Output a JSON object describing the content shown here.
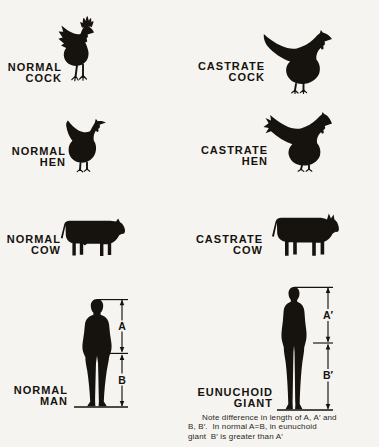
{
  "colors": {
    "background": "#f5f4f0",
    "ink": "#16130f"
  },
  "specimens": [
    {
      "name": "normal-cock",
      "label": [
        "NORMAL",
        "COCK"
      ],
      "icon": "rooster-large-comb-silhouette"
    },
    {
      "name": "castrate-cock",
      "label": [
        "CASTRATE",
        "COCK"
      ],
      "icon": "capon-silhouette"
    },
    {
      "name": "normal-hen",
      "label": [
        "NORMAL",
        "HEN"
      ],
      "icon": "hen-silhouette"
    },
    {
      "name": "castrate-hen",
      "label": [
        "CASTRATE",
        "HEN"
      ],
      "icon": "poularde-long-tail-silhouette"
    },
    {
      "name": "normal-cow",
      "label": [
        "NORMAL",
        "COW"
      ],
      "icon": "cow-silhouette"
    },
    {
      "name": "castrate-cow",
      "label": [
        "CASTRATE",
        "COW"
      ],
      "icon": "ox-horned-silhouette"
    },
    {
      "name": "normal-man",
      "label": [
        "NORMAL",
        "MAN"
      ],
      "icon": "man-silhouette"
    },
    {
      "name": "eunuchoid-giant",
      "label": [
        "EUNUCHOID",
        "GIANT"
      ],
      "icon": "tall-man-silhouette"
    }
  ],
  "measurements": {
    "normal_man": {
      "upper": "A",
      "lower": "B"
    },
    "eunuchoid_giant": {
      "upper": "A′",
      "lower": "B′"
    }
  },
  "note": {
    "lines": [
      "Note difference in length of A, A′ and",
      "B, B′.  In normal A=B, in eunuchoid",
      "giant  B′ is greater than A′"
    ]
  }
}
